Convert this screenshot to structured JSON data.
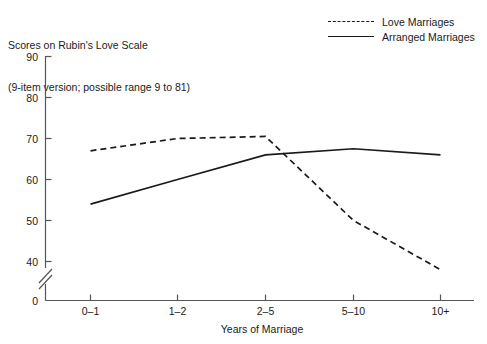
{
  "chart_data": {
    "type": "line",
    "title": "Scores on Rubin's Love Scale (9-item version; possible range 9 to 81)",
    "title_lines": [
      "Scores on Rubin's Love Scale",
      "(9-item version; possible range 9 to 81)"
    ],
    "xlabel": "Years of Marriage",
    "ylabel": "",
    "categories": [
      "0–1",
      "1–2",
      "2–5",
      "5–10",
      "10+"
    ],
    "yticks": [
      0,
      40,
      50,
      60,
      70,
      80,
      90
    ],
    "ytick_labels": [
      "0",
      "40",
      "50",
      "60",
      "70",
      "80",
      "90"
    ],
    "ylim": [
      40,
      90
    ],
    "y_axis_break": true,
    "y_axis_break_note": "axis break between 0 and 40",
    "grid": false,
    "legend_position": "top-right",
    "series": [
      {
        "name": "Love Marriages",
        "style": "dashed",
        "color": "#1a1a1a",
        "values": [
          67,
          70,
          70.5,
          50,
          38
        ]
      },
      {
        "name": "Arranged Marriages",
        "style": "solid",
        "color": "#1a1a1a",
        "values": [
          54,
          60,
          66,
          67.5,
          66
        ]
      }
    ]
  },
  "legend": {
    "items": [
      {
        "label": "Love Marriages",
        "style": "dashed"
      },
      {
        "label": "Arranged Marriages",
        "style": "solid"
      }
    ]
  },
  "axes": {
    "x_title": "Years of Marriage",
    "x_tick_labels": [
      "0–1",
      "1–2",
      "2–5",
      "5–10",
      "10+"
    ],
    "y_tick_labels": [
      "90",
      "80",
      "70",
      "60",
      "50",
      "40",
      "0"
    ]
  },
  "colors": {
    "ink": "#1a1a1a",
    "axis": "#555555",
    "background": "#ffffff"
  }
}
